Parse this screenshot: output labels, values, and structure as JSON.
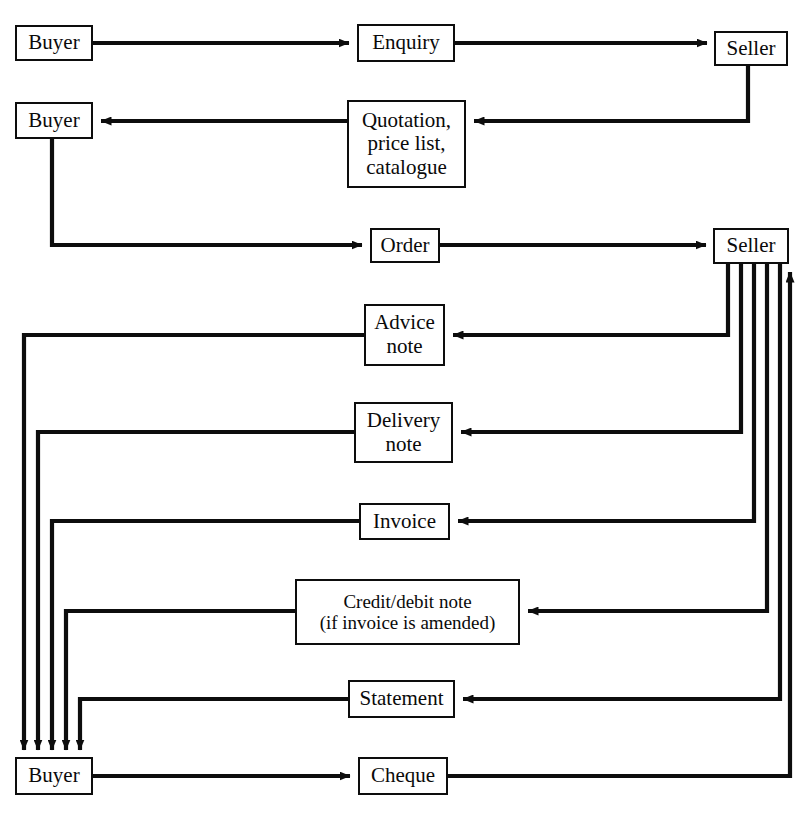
{
  "diagram": {
    "type": "flowchart",
    "stroke_color": "#0d0d0d",
    "background_color": "#ffffff",
    "nodes": [
      {
        "id": "buyer1",
        "label": "Buyer",
        "x": 15,
        "y": 25,
        "w": 78,
        "h": 36,
        "role": "party"
      },
      {
        "id": "enquiry",
        "label": "Enquiry",
        "x": 357,
        "y": 24,
        "w": 98,
        "h": 38,
        "role": "document"
      },
      {
        "id": "seller1",
        "label": "Seller",
        "x": 714,
        "y": 31,
        "w": 74,
        "h": 35,
        "role": "party"
      },
      {
        "id": "buyer2",
        "label": "Buyer",
        "x": 15,
        "y": 102,
        "w": 78,
        "h": 37,
        "role": "party"
      },
      {
        "id": "quotation",
        "label": "Quotation,\nprice list,\ncatalogue",
        "x": 347,
        "y": 100,
        "w": 119,
        "h": 88,
        "role": "document"
      },
      {
        "id": "order",
        "label": "Order",
        "x": 370,
        "y": 228,
        "w": 70,
        "h": 35,
        "role": "document"
      },
      {
        "id": "seller2",
        "label": "Seller",
        "x": 713,
        "y": 228,
        "w": 76,
        "h": 36,
        "role": "party"
      },
      {
        "id": "advice",
        "label": "Advice\nnote",
        "x": 364,
        "y": 304,
        "w": 81,
        "h": 62,
        "role": "document"
      },
      {
        "id": "delivery",
        "label": "Delivery\nnote",
        "x": 354,
        "y": 402,
        "w": 99,
        "h": 61,
        "role": "document"
      },
      {
        "id": "invoice",
        "label": "Invoice",
        "x": 359,
        "y": 503,
        "w": 91,
        "h": 37,
        "role": "document"
      },
      {
        "id": "credit",
        "label": "Credit/debit note\n(if invoice is amended)",
        "x": 295,
        "y": 579,
        "w": 225,
        "h": 66,
        "role": "document"
      },
      {
        "id": "statement",
        "label": "Statement",
        "x": 348,
        "y": 680,
        "w": 107,
        "h": 38,
        "role": "document"
      },
      {
        "id": "buyer3",
        "label": "Buyer",
        "x": 15,
        "y": 757,
        "w": 78,
        "h": 38,
        "role": "party"
      },
      {
        "id": "cheque",
        "label": "Cheque",
        "x": 358,
        "y": 757,
        "w": 90,
        "h": 38,
        "role": "document"
      }
    ],
    "edges": [
      {
        "from": "buyer1",
        "to": "enquiry",
        "label": ""
      },
      {
        "from": "enquiry",
        "to": "seller1",
        "label": ""
      },
      {
        "from": "seller1",
        "to": "quotation",
        "label": ""
      },
      {
        "from": "quotation",
        "to": "buyer2",
        "label": ""
      },
      {
        "from": "buyer2",
        "to": "order",
        "label": ""
      },
      {
        "from": "order",
        "to": "seller2",
        "label": ""
      },
      {
        "from": "seller2",
        "to": "advice",
        "label": ""
      },
      {
        "from": "advice",
        "to": "buyer3",
        "label": ""
      },
      {
        "from": "seller2",
        "to": "delivery",
        "label": ""
      },
      {
        "from": "delivery",
        "to": "buyer3",
        "label": ""
      },
      {
        "from": "seller2",
        "to": "invoice",
        "label": ""
      },
      {
        "from": "invoice",
        "to": "buyer3",
        "label": ""
      },
      {
        "from": "seller2",
        "to": "credit",
        "label": ""
      },
      {
        "from": "credit",
        "to": "buyer3",
        "label": ""
      },
      {
        "from": "seller2",
        "to": "statement",
        "label": ""
      },
      {
        "from": "statement",
        "to": "buyer3",
        "label": ""
      },
      {
        "from": "buyer3",
        "to": "cheque",
        "label": ""
      },
      {
        "from": "cheque",
        "to": "seller2",
        "label": ""
      }
    ]
  }
}
